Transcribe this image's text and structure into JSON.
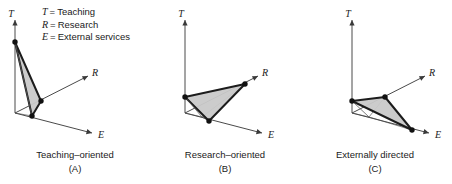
{
  "figure": {
    "type": "diagram",
    "legend": {
      "equals": "=",
      "items": [
        {
          "key": "T",
          "term": "Teaching"
        },
        {
          "key": "R",
          "term": "Research"
        },
        {
          "key": "E",
          "term": "External services"
        }
      ]
    },
    "axis_labels": {
      "t": "T",
      "r": "R",
      "e": "E"
    },
    "colors": {
      "triangle_fill": "#c9c9c9",
      "triangle_stroke": "#1c1c1c",
      "axis": "#4a4a4a",
      "text": "#1a1a1a",
      "background": "#ffffff"
    },
    "panels": [
      {
        "id": "A",
        "tag": "(A)",
        "title": "Teaching–oriented",
        "origin": {
          "x": 15,
          "y": 113
        },
        "axes": {
          "t_end": {
            "x": 15,
            "y": 20
          },
          "r_end": {
            "x": 88,
            "y": 76
          },
          "e_end": {
            "x": 92,
            "y": 133
          }
        },
        "axis_label_pos": {
          "t": {
            "x": 11,
            "y": 15
          },
          "r": {
            "x": 92,
            "y": 74
          },
          "e": {
            "x": 98,
            "y": 136
          }
        },
        "vertices": {
          "t_point": {
            "x": 15,
            "y": 42
          },
          "r_point": {
            "x": 41,
            "y": 101
          },
          "e_point": {
            "x": 32,
            "y": 116
          }
        },
        "base_corner": {
          "x": 32,
          "y": 116
        },
        "magnitudes": {
          "teaching": "high",
          "research": "low",
          "external": "low"
        }
      },
      {
        "id": "B",
        "tag": "(B)",
        "title": "Research–oriented",
        "origin": {
          "x": 185,
          "y": 113
        },
        "axes": {
          "t_end": {
            "x": 185,
            "y": 20
          },
          "r_end": {
            "x": 258,
            "y": 76
          },
          "e_end": {
            "x": 262,
            "y": 133
          }
        },
        "axis_label_pos": {
          "t": {
            "x": 181,
            "y": 15
          },
          "r": {
            "x": 262,
            "y": 74
          },
          "e": {
            "x": 268,
            "y": 136
          }
        },
        "vertices": {
          "t_point": {
            "x": 185,
            "y": 97
          },
          "r_point": {
            "x": 245,
            "y": 84
          },
          "e_point": {
            "x": 209,
            "y": 121
          }
        },
        "base_corner": {
          "x": 202,
          "y": 117
        },
        "magnitudes": {
          "teaching": "low",
          "research": "high",
          "external": "low"
        }
      },
      {
        "id": "C",
        "tag": "(C)",
        "title": "Externally directed",
        "origin": {
          "x": 352,
          "y": 113
        },
        "axes": {
          "t_end": {
            "x": 352,
            "y": 20
          },
          "r_end": {
            "x": 425,
            "y": 76
          },
          "e_end": {
            "x": 429,
            "y": 133
          }
        },
        "axis_label_pos": {
          "t": {
            "x": 348,
            "y": 15
          },
          "r": {
            "x": 429,
            "y": 74
          },
          "e": {
            "x": 435,
            "y": 136
          }
        },
        "vertices": {
          "t_point": {
            "x": 352,
            "y": 101
          },
          "r_point": {
            "x": 385,
            "y": 97
          },
          "e_point": {
            "x": 412,
            "y": 130
          }
        },
        "base_corner": {
          "x": 369,
          "y": 117
        },
        "magnitudes": {
          "teaching": "low",
          "research": "low",
          "external": "high"
        }
      }
    ]
  }
}
